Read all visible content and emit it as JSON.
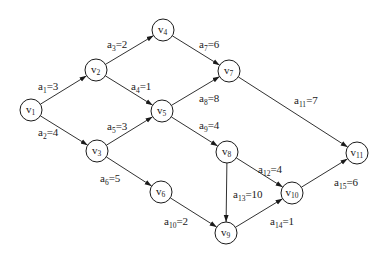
{
  "diagram": {
    "type": "AOE activity network (directed acyclic graph)",
    "node_radius": 11,
    "colors": {
      "stroke": "#1a1a1a",
      "background": "#ffffff"
    },
    "nodes": [
      {
        "id": "v1",
        "base": "v",
        "sub": "1",
        "x": 31,
        "y": 110
      },
      {
        "id": "v2",
        "base": "v",
        "sub": "2",
        "x": 96,
        "y": 70
      },
      {
        "id": "v3",
        "base": "v",
        "sub": "3",
        "x": 97,
        "y": 151
      },
      {
        "id": "v4",
        "base": "v",
        "sub": "4",
        "x": 163,
        "y": 30
      },
      {
        "id": "v5",
        "base": "v",
        "sub": "5",
        "x": 162,
        "y": 111
      },
      {
        "id": "v6",
        "base": "v",
        "sub": "6",
        "x": 161,
        "y": 192
      },
      {
        "id": "v7",
        "base": "v",
        "sub": "7",
        "x": 229,
        "y": 71
      },
      {
        "id": "v8",
        "base": "v",
        "sub": "8",
        "x": 227,
        "y": 152
      },
      {
        "id": "v9",
        "base": "v",
        "sub": "9",
        "x": 226,
        "y": 233
      },
      {
        "id": "v10",
        "base": "v",
        "sub": "10",
        "x": 292,
        "y": 193
      },
      {
        "id": "v11",
        "base": "v",
        "sub": "11",
        "x": 357,
        "y": 153
      }
    ],
    "edges": [
      {
        "id": "a1",
        "from": "v1",
        "to": "v2",
        "base": "a",
        "sub": "1",
        "weight": "3",
        "label_x": 38,
        "label_y": 90
      },
      {
        "id": "a2",
        "from": "v1",
        "to": "v3",
        "base": "a",
        "sub": "2",
        "weight": "4",
        "label_x": 38,
        "label_y": 136
      },
      {
        "id": "a3",
        "from": "v2",
        "to": "v4",
        "base": "a",
        "sub": "3",
        "weight": "2",
        "label_x": 107,
        "label_y": 48
      },
      {
        "id": "a4",
        "from": "v2",
        "to": "v5",
        "base": "a",
        "sub": "4",
        "weight": "1",
        "label_x": 131,
        "label_y": 90
      },
      {
        "id": "a5",
        "from": "v3",
        "to": "v5",
        "base": "a",
        "sub": "5",
        "weight": "3",
        "label_x": 107,
        "label_y": 130
      },
      {
        "id": "a6",
        "from": "v3",
        "to": "v6",
        "base": "a",
        "sub": "6",
        "weight": "5",
        "label_x": 100,
        "label_y": 182
      },
      {
        "id": "a7",
        "from": "v4",
        "to": "v7",
        "base": "a",
        "sub": "7",
        "weight": "6",
        "label_x": 199,
        "label_y": 48
      },
      {
        "id": "a8",
        "from": "v5",
        "to": "v7",
        "base": "a",
        "sub": "8",
        "weight": "8",
        "label_x": 199,
        "label_y": 102
      },
      {
        "id": "a9",
        "from": "v5",
        "to": "v8",
        "base": "a",
        "sub": "9",
        "weight": "4",
        "label_x": 199,
        "label_y": 129
      },
      {
        "id": "a10",
        "from": "v6",
        "to": "v9",
        "base": "a",
        "sub": "10",
        "weight": "2",
        "label_x": 164,
        "label_y": 225
      },
      {
        "id": "a11",
        "from": "v7",
        "to": "v11",
        "base": "a",
        "sub": "11",
        "weight": "7",
        "label_x": 294,
        "label_y": 104
      },
      {
        "id": "a12",
        "from": "v8",
        "to": "v10",
        "base": "a",
        "sub": "12",
        "weight": "4",
        "label_x": 258,
        "label_y": 173
      },
      {
        "id": "a13",
        "from": "v8",
        "to": "v9",
        "base": "a",
        "sub": "13",
        "weight": "10",
        "label_x": 233,
        "label_y": 198
      },
      {
        "id": "a14",
        "from": "v9",
        "to": "v10",
        "base": "a",
        "sub": "14",
        "weight": "1",
        "label_x": 270,
        "label_y": 225
      },
      {
        "id": "a15",
        "from": "v10",
        "to": "v11",
        "base": "a",
        "sub": "15",
        "weight": "6",
        "label_x": 334,
        "label_y": 186
      }
    ]
  }
}
